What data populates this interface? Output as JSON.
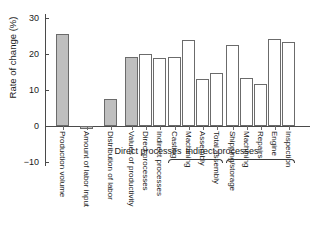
{
  "chart_data": {
    "type": "bar",
    "title": "",
    "xlabel": "",
    "ylabel": "Rate of change (%)",
    "ylim": [
      -13,
      33
    ],
    "yticks": [
      30,
      20,
      10,
      0,
      -10
    ],
    "ytick_labels": [
      "30",
      "20",
      "10",
      "0",
      "−10"
    ],
    "grid": false,
    "legend": "none",
    "categories": [
      "Production volume",
      "Amount of labor input",
      "Distribution of labor",
      "Values of productivity",
      "Direct processes",
      "Indirect processes",
      "Casting",
      "Machining",
      "Assembly",
      "Total assembly",
      "Shipping/storage",
      "Machining",
      "Repairs",
      "Engine",
      "Inspection"
    ],
    "values": [
      25.5,
      -0.7,
      7.5,
      19.2,
      20.0,
      19.0,
      19.2,
      24.0,
      13.0,
      14.8,
      22.5,
      13.3,
      11.8,
      24.2,
      23.3
    ],
    "fills": [
      "gray",
      "gray",
      "gray",
      "gray",
      "white",
      "white",
      "white",
      "white",
      "white",
      "white",
      "white",
      "white",
      "white",
      "white",
      "white"
    ],
    "groups": [
      {
        "label": "Direct processes",
        "members": [
          "Casting",
          "Machining",
          "Assembly",
          "Total assembly"
        ]
      },
      {
        "label": "Indirect processes",
        "members": [
          "Shipping/storage",
          "Machining",
          "Repairs",
          "Engine",
          "Inspection"
        ]
      }
    ]
  },
  "colors": {
    "bar_gray_fill": "#bfbfbf",
    "bar_white_fill": "#ffffff",
    "bar_stroke": "#6b6b6b",
    "axis": "#4a4a4a",
    "text": "#1a1a1a",
    "background": "#ffffff"
  }
}
